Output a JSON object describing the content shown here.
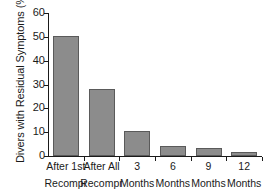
{
  "chart_data": {
    "type": "bar",
    "title": "",
    "xlabel": "",
    "ylabel": "Divers with Residual Symptoms (%)",
    "categories": [
      "After 1st Recompr",
      "After All Recompr",
      "3 Months",
      "6 Months",
      "9 Months",
      "12 Months"
    ],
    "category_lines": [
      [
        "After 1st",
        "Recompr"
      ],
      [
        "After All",
        "Recompr"
      ],
      [
        "3",
        "Months"
      ],
      [
        "6",
        "Months"
      ],
      [
        "9",
        "Months"
      ],
      [
        "12",
        "Months"
      ]
    ],
    "values": [
      50.5,
      28.0,
      10.5,
      4.2,
      3.5,
      1.5
    ],
    "ylim": [
      0,
      60
    ],
    "yticks": [
      0,
      10,
      20,
      30,
      40,
      50,
      60
    ],
    "ytick_labels": [
      "0",
      "10",
      "20",
      "30",
      "40",
      "50",
      "60"
    ],
    "grid": false,
    "legend": null,
    "bar_color": "#8c8c8c",
    "bar_edge_color": "#5a5a5a",
    "axis_color": "#1a1a1a",
    "background": "#ffffff"
  }
}
